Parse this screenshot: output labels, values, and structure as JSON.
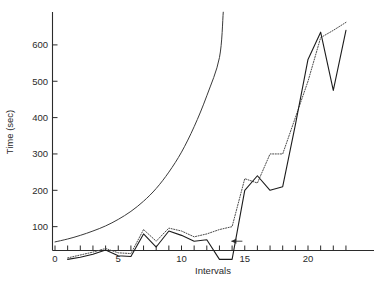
{
  "chart_data": {
    "type": "line",
    "title": "",
    "xlabel": "Intervals",
    "ylabel": "Time (sec)",
    "xlim": [
      0,
      23.5
    ],
    "ylim": [
      0,
      690
    ],
    "xticks": [
      0,
      1,
      2,
      3,
      4,
      5,
      6,
      7,
      8,
      9,
      10,
      11,
      12,
      13,
      14,
      15,
      16,
      17,
      18,
      19,
      20,
      21,
      22,
      23
    ],
    "xtick_labels": [
      "0",
      "",
      "",
      "",
      "",
      "5",
      "",
      "",
      "",
      "",
      "10",
      "",
      "",
      "",
      "",
      "15",
      "",
      "",
      "",
      "",
      "20",
      "",
      "",
      ""
    ],
    "yticks": [
      100,
      200,
      300,
      400,
      500,
      600
    ],
    "ytick_labels": [
      "100",
      "200",
      "300",
      "400",
      "500",
      "600"
    ],
    "grid": false,
    "legend": "none",
    "series": [
      {
        "name": "smooth-exponential",
        "style": "solid-smooth",
        "color": "#3a3a3a",
        "x": [
          0,
          1,
          2,
          3,
          4,
          5,
          6,
          7,
          8,
          9,
          10,
          11,
          12,
          13,
          13.3
        ],
        "values": [
          58,
          66,
          76,
          88,
          102,
          120,
          142,
          170,
          205,
          250,
          305,
          375,
          460,
          565,
          690
        ]
      },
      {
        "name": "dotted-series",
        "style": "dotted",
        "color": "#4a4a4a",
        "x": [
          1,
          2,
          3,
          4,
          5,
          6,
          7,
          8,
          9,
          10,
          11,
          12,
          13,
          14,
          15,
          16,
          17,
          18,
          19,
          20,
          21,
          22,
          23
        ],
        "values": [
          14,
          22,
          30,
          40,
          28,
          26,
          92,
          60,
          96,
          88,
          72,
          80,
          92,
          100,
          232,
          220,
          300,
          300,
          400,
          500,
          620,
          640,
          662
        ]
      },
      {
        "name": "solid-series",
        "style": "solid",
        "color": "#1c1c1c",
        "x": [
          1,
          2,
          3,
          4,
          5,
          6,
          7,
          8,
          9,
          10,
          11,
          12,
          13,
          14,
          15,
          16,
          17,
          18,
          19,
          20,
          21,
          22,
          23
        ],
        "values": [
          10,
          16,
          24,
          36,
          20,
          18,
          80,
          44,
          88,
          76,
          60,
          64,
          10,
          10,
          200,
          240,
          200,
          210,
          380,
          560,
          635,
          475,
          640
        ]
      }
    ],
    "annotations": [
      {
        "name": "left-arrow-marker",
        "x": 14.1,
        "y": 60,
        "direction": "left"
      }
    ]
  },
  "caption": {
    "fragment": ""
  }
}
